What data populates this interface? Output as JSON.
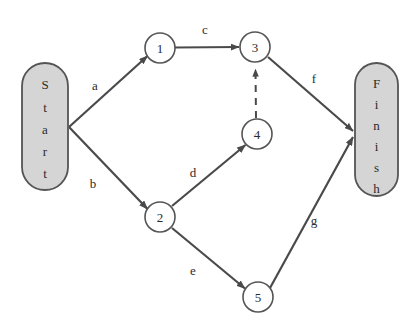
{
  "diagram": {
    "type": "activity-on-arrow-network",
    "colors": {
      "background": "#ffffff",
      "stroke": "#4a4a4a",
      "terminal_fill": "#d5d5d5",
      "terminal_stroke": "#555555",
      "node_fill": "#ffffff",
      "node_stroke": "#555555",
      "text": "#2b2b2b"
    },
    "terminals": [
      {
        "id": "start",
        "text": "Start",
        "letters": [
          "S",
          "t",
          "a",
          "r",
          "t"
        ],
        "shape": "stadium"
      },
      {
        "id": "finish",
        "text": "Finish",
        "letters": [
          "F",
          "i",
          "n",
          "i",
          "s",
          "h"
        ],
        "shape": "stadium"
      }
    ],
    "nodes": [
      {
        "id": "n1",
        "label": "1",
        "cx": 160,
        "cy": 48,
        "r": 15
      },
      {
        "id": "n2",
        "label": "2",
        "cx": 160,
        "cy": 217,
        "r": 15
      },
      {
        "id": "n3",
        "label": "3",
        "cx": 255,
        "cy": 47,
        "r": 15
      },
      {
        "id": "n4",
        "label": "4",
        "cx": 257,
        "cy": 134,
        "r": 15
      },
      {
        "id": "n5",
        "label": "5",
        "cx": 258,
        "cy": 297,
        "r": 15
      }
    ],
    "edges": [
      {
        "id": "a",
        "label": "a",
        "from": "start",
        "to": "n1",
        "style": "solid",
        "label_x": 95,
        "label_y": 85
      },
      {
        "id": "b",
        "label": "b",
        "from": "start",
        "to": "n2",
        "style": "solid",
        "label_x": 93,
        "label_y": 183
      },
      {
        "id": "c",
        "label": "c",
        "from": "n1",
        "to": "n3",
        "style": "solid",
        "label_x": 205,
        "label_y": 29
      },
      {
        "id": "d",
        "label": "d",
        "from": "n2",
        "to": "n4",
        "style": "solid",
        "label_x": 193,
        "label_y": 172
      },
      {
        "id": "e",
        "label": "e",
        "from": "n2",
        "to": "n5",
        "style": "solid",
        "label_x": 193,
        "label_y": 270
      },
      {
        "id": "f",
        "label": "f",
        "from": "n3",
        "to": "finish",
        "style": "solid",
        "label_x": 314,
        "label_y": 78
      },
      {
        "id": "g",
        "label": "g",
        "from": "n5",
        "to": "finish",
        "style": "solid",
        "label_x": 314,
        "label_y": 220
      },
      {
        "id": "dummy",
        "label": "",
        "from": "n4",
        "to": "n3",
        "style": "dashed",
        "label_x": 0,
        "label_y": 0
      }
    ]
  }
}
